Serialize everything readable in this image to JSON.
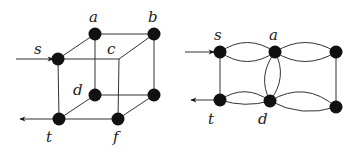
{
  "figure": {
    "left_graph": {
      "name": "cube-graph",
      "labels": {
        "s": "s",
        "a": "a",
        "b": "b",
        "c": "c",
        "d": "d",
        "t": "t",
        "f": "f"
      }
    },
    "right_graph": {
      "name": "multigraph",
      "labels": {
        "s": "s",
        "a": "a",
        "t": "t",
        "d": "d"
      }
    },
    "colors": {
      "node": "#111111",
      "edge": "#333333",
      "background": "#ffffff"
    }
  }
}
